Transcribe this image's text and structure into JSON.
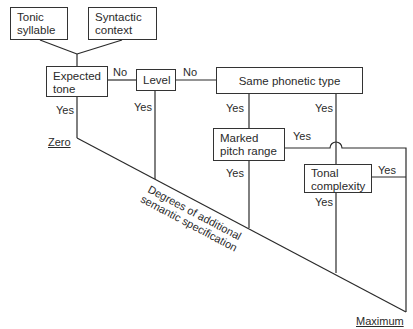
{
  "nodes": {
    "tonic_syllable": "Tonic syllable",
    "tonic_syllable_l1": "Tonic",
    "tonic_syllable_l2": "syllable",
    "syntactic_context_l1": "Syntactic",
    "syntactic_context_l2": "context",
    "expected_tone_l1": "Expected",
    "expected_tone_l2": "tone",
    "level": "Level",
    "same_phonetic_type": "Same phonetic type",
    "marked_pitch_range_l1": "Marked",
    "marked_pitch_range_l2": "pitch range",
    "tonal_complexity_l1": "Tonal",
    "tonal_complexity_l2": "complexity"
  },
  "edges": {
    "expected_no": "No",
    "expected_yes": "Yes",
    "level_no": "No",
    "level_yes": "Yes",
    "same_yes_left": "Yes",
    "same_yes_right": "Yes",
    "marked_yes_right": "Yes",
    "marked_yes_down": "Yes",
    "tonal_yes_right": "Yes",
    "tonal_yes_down": "Yes"
  },
  "scale": {
    "zero": "Zero",
    "maximum": "Maximum",
    "axis_l1": "Degrees of additional",
    "axis_l2": "semantic specification"
  }
}
